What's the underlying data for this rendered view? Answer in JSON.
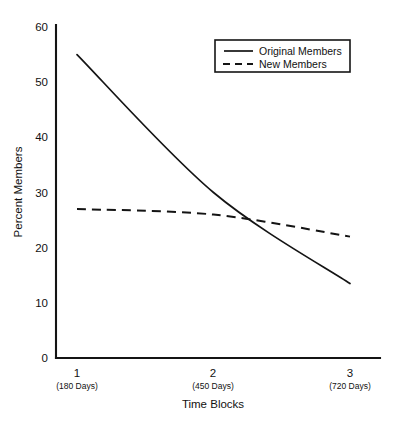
{
  "chart_data": {
    "type": "line",
    "title": "",
    "subtitle": "",
    "xlabel": "Time Blocks",
    "ylabel": "Percent Members",
    "categories": [
      "1",
      "2",
      "3"
    ],
    "category_sublabels": [
      "(180 Days)",
      "(450 Days)",
      "(720 Days)"
    ],
    "x": [
      1,
      2,
      3
    ],
    "xlim": [
      0.75,
      3.2
    ],
    "ylim": [
      0,
      60
    ],
    "yticks": [
      0,
      10,
      20,
      30,
      40,
      50,
      60
    ],
    "ytick_labels": [
      "0",
      "10",
      "20",
      "30",
      "40",
      "50",
      "60"
    ],
    "grid": false,
    "legend_position": "top-right",
    "series": [
      {
        "name": "Original Members",
        "style": "solid",
        "color": "#141414",
        "values": [
          55,
          30,
          13.5
        ]
      },
      {
        "name": "New Members",
        "style": "dashed",
        "color": "#141414",
        "values": [
          27,
          26,
          22
        ]
      }
    ],
    "annotations": []
  },
  "axes": {
    "y_title": "Percent Members",
    "x_title": "Time Blocks",
    "y_ticks": [
      {
        "value": 60,
        "label": "60"
      },
      {
        "value": 50,
        "label": "50"
      },
      {
        "value": 40,
        "label": "40"
      },
      {
        "value": 30,
        "label": "30"
      },
      {
        "value": 20,
        "label": "20"
      },
      {
        "value": 10,
        "label": "10"
      },
      {
        "value": 0,
        "label": "0"
      }
    ],
    "x_ticks": [
      {
        "value": 1,
        "label": "1",
        "sublabel": "(180 Days)"
      },
      {
        "value": 2,
        "label": "2",
        "sublabel": "(450 Days)"
      },
      {
        "value": 3,
        "label": "3",
        "sublabel": "(720 Days)"
      }
    ]
  },
  "legend": {
    "entries": [
      {
        "label": "Original Members",
        "style": "solid"
      },
      {
        "label": "New Members",
        "style": "dashed"
      }
    ]
  },
  "colors": {
    "ink": "#141414",
    "background": "#ffffff"
  }
}
